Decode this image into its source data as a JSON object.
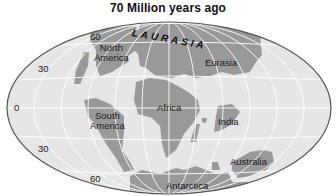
{
  "title": "70 Million years ago",
  "supercontinent_label": "LAURASIA",
  "continents": [
    {
      "name": "North America"
    },
    {
      "name": "Eurasia"
    },
    {
      "name": "South America"
    },
    {
      "name": "Africa"
    },
    {
      "name": "India"
    },
    {
      "name": "Australia"
    },
    {
      "name": "Antarctica"
    }
  ],
  "labels": {
    "north_america_l1": "North",
    "north_america_l2": "America",
    "eurasia": "Eurasia",
    "south_america_l1": "South",
    "south_america_l2": "America",
    "africa": "Africa",
    "india": "India",
    "australia": "Australia",
    "antarctica": "Antarctica"
  },
  "latitude_labels": {
    "n60": "60",
    "n30": "30",
    "eq": "0",
    "s30": "30",
    "s60": "60"
  },
  "colors": {
    "ocean": "#e6e6e6",
    "land": "#9a9a9a",
    "ice": "#f4f4f4",
    "grid": "#ffffff",
    "outline": "#555555"
  }
}
